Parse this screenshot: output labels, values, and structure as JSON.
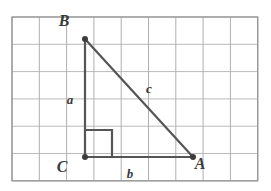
{
  "figure": {
    "canvas": {
      "width": 271,
      "height": 191,
      "background": "#ffffff"
    },
    "grid": {
      "x0": 12,
      "y0": 17,
      "cell": 27.3,
      "cols": 9,
      "rows": 6,
      "line_color": "#b0b0b0",
      "border_color": "#9a9a9a",
      "line_width": 1
    },
    "triangle": {
      "stroke": "#555555",
      "stroke_width": 2.2,
      "vertex_dot_color": "#3c3c3c",
      "vertex_dot_radius": 3,
      "vertices": [
        {
          "name": "B",
          "label": "B",
          "x": 85,
          "y": 39,
          "label_x": 64,
          "label_y": 26
        },
        {
          "name": "C",
          "label": "C",
          "x": 85,
          "y": 157,
          "label_x": 62,
          "label_y": 172
        },
        {
          "name": "A",
          "label": "A",
          "x": 193,
          "y": 157,
          "label_x": 200,
          "label_y": 169
        }
      ],
      "sides": [
        {
          "name": "a",
          "label": "a",
          "from": "B",
          "to": "C",
          "label_x": 70,
          "label_y": 104
        },
        {
          "name": "b",
          "label": "b",
          "from": "C",
          "to": "A",
          "label_x": 130,
          "label_y": 178
        },
        {
          "name": "c",
          "label": "c",
          "from": "B",
          "to": "A",
          "label_x": 149,
          "label_y": 93
        }
      ],
      "right_angle_marker": {
        "at": "C",
        "size": 27,
        "stroke": "#555555",
        "stroke_width": 2.2
      }
    }
  }
}
